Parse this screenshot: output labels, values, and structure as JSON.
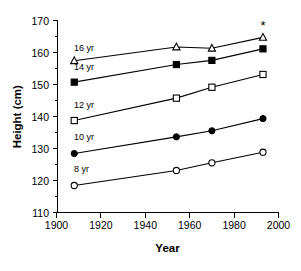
{
  "chart_data": {
    "type": "line",
    "title": "",
    "xlabel": "Year",
    "ylabel": "Height (cm)",
    "xlim": [
      1900,
      2000
    ],
    "ylim": [
      110,
      170
    ],
    "xticks": [
      1900,
      1920,
      1940,
      1960,
      1980,
      2000
    ],
    "xtick_labels": [
      "1900",
      "1920",
      "1940",
      "1960",
      "1980",
      "2000"
    ],
    "yticks": [
      110,
      120,
      130,
      140,
      150,
      160,
      170
    ],
    "ytick_labels": [
      "110",
      "120",
      "130",
      "140",
      "150",
      "160",
      "170"
    ],
    "grid": false,
    "legend_position": "inline-left-of-series",
    "x": [
      1908,
      1954,
      1970,
      1993
    ],
    "series": [
      {
        "name": "16 yr",
        "label": "16 yr",
        "marker": "open-triangle",
        "values": [
          157.5,
          161.8,
          161.4,
          164.8
        ]
      },
      {
        "name": "14 yr",
        "label": "14 yr",
        "marker": "filled-square",
        "values": [
          150.8,
          156.3,
          157.6,
          161.2
        ]
      },
      {
        "name": "12 yr",
        "label": "12 yr",
        "marker": "open-square",
        "values": [
          138.8,
          145.8,
          149.2,
          153.2
        ]
      },
      {
        "name": "10 yr",
        "label": "10 yr",
        "marker": "filled-circle",
        "values": [
          128.5,
          133.7,
          135.6,
          139.4
        ]
      },
      {
        "name": "8 yr",
        "label": "8 yr",
        "marker": "open-circle",
        "values": [
          118.5,
          123.2,
          125.6,
          128.9
        ]
      }
    ],
    "annotations": [
      {
        "text": "*",
        "x": 1993,
        "y": 167.0,
        "series": "16 yr"
      }
    ]
  },
  "labels": {
    "y_axis_title": "Height (cm)",
    "x_axis_title": "Year",
    "star": "*"
  }
}
